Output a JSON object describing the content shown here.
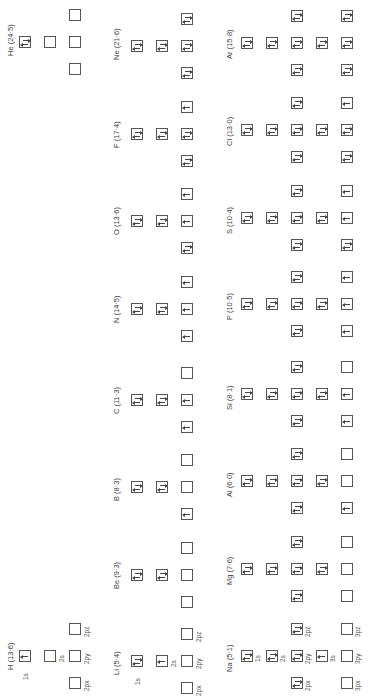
{
  "diagram": {
    "orientation": "rotated-90-ccw",
    "orbital_labels_row1": [
      "1s",
      "2s",
      "2px",
      "2py",
      "2pz"
    ],
    "orbital_labels_row3": [
      "1s",
      "2s",
      "2px",
      "2py",
      "2pz",
      "3s",
      "3px",
      "3py",
      "3pz"
    ]
  },
  "elements": [
    {
      "symbol": "H",
      "label": "H (13·6)",
      "ie": "13·6",
      "config": {
        "1s": 1
      }
    },
    {
      "symbol": "He",
      "label": "He (24·5)",
      "ie": "24·5",
      "config": {
        "1s": 2
      }
    },
    {
      "symbol": "Li",
      "label": "Li (5·4)",
      "ie": "5·4",
      "config": {
        "1s": 2,
        "2s": 1
      }
    },
    {
      "symbol": "Be",
      "label": "Be (9·3)",
      "ie": "9·3",
      "config": {
        "1s": 2,
        "2s": 2
      }
    },
    {
      "symbol": "B",
      "label": "B (8·3)",
      "ie": "8·3",
      "config": {
        "1s": 2,
        "2s": 2,
        "2px": 1
      }
    },
    {
      "symbol": "C",
      "label": "C (11·3)",
      "ie": "11·3",
      "config": {
        "1s": 2,
        "2s": 2,
        "2px": 1,
        "2py": 1
      }
    },
    {
      "symbol": "N",
      "label": "N (14·5)",
      "ie": "14·5",
      "config": {
        "1s": 2,
        "2s": 2,
        "2px": 1,
        "2py": 1,
        "2pz": 1
      }
    },
    {
      "symbol": "O",
      "label": "O (13·6)",
      "ie": "13·6",
      "config": {
        "1s": 2,
        "2s": 2,
        "2px": 2,
        "2py": 1,
        "2pz": 1
      }
    },
    {
      "symbol": "F",
      "label": "F (17·4)",
      "ie": "17·4",
      "config": {
        "1s": 2,
        "2s": 2,
        "2px": 2,
        "2py": 2,
        "2pz": 1
      }
    },
    {
      "symbol": "Ne",
      "label": "Ne (21·6)",
      "ie": "21·6",
      "config": {
        "1s": 2,
        "2s": 2,
        "2px": 2,
        "2py": 2,
        "2pz": 2
      }
    },
    {
      "symbol": "Na",
      "label": "Na (5·1)",
      "ie": "5·1",
      "config": {
        "1s": 2,
        "2s": 2,
        "2p": 6,
        "3s": 1
      }
    },
    {
      "symbol": "Mg",
      "label": "Mg (7·6)",
      "ie": "7·6",
      "config": {
        "1s": 2,
        "2s": 2,
        "2p": 6,
        "3s": 2
      }
    },
    {
      "symbol": "Al",
      "label": "Al (6·0)",
      "ie": "6·0",
      "config": {
        "1s": 2,
        "2s": 2,
        "2p": 6,
        "3s": 2,
        "3px": 1
      }
    },
    {
      "symbol": "Si",
      "label": "Si (8·1)",
      "ie": "8·1",
      "config": {
        "1s": 2,
        "2s": 2,
        "2p": 6,
        "3s": 2,
        "3px": 1,
        "3py": 1
      }
    },
    {
      "symbol": "P",
      "label": "P (10·5)",
      "ie": "10·5",
      "config": {
        "1s": 2,
        "2s": 2,
        "2p": 6,
        "3s": 2,
        "3px": 1,
        "3py": 1,
        "3pz": 1
      }
    },
    {
      "symbol": "S",
      "label": "S (10·4)",
      "ie": "10·4",
      "config": {
        "1s": 2,
        "2s": 2,
        "2p": 6,
        "3s": 2,
        "3px": 2,
        "3py": 1,
        "3pz": 1
      }
    },
    {
      "symbol": "Cl",
      "label": "Cl (13·0)",
      "ie": "13·0",
      "config": {
        "1s": 2,
        "2s": 2,
        "2p": 6,
        "3s": 2,
        "3px": 2,
        "3py": 2,
        "3pz": 1
      }
    },
    {
      "symbol": "Ar",
      "label": "Ar (15·8)",
      "ie": "15·8",
      "config": {
        "1s": 2,
        "2s": 2,
        "2p": 6,
        "3s": 2,
        "3px": 2,
        "3py": 2,
        "3pz": 2
      }
    }
  ],
  "labels": {
    "H": "H (13·6)",
    "He": "He (24·5)",
    "Li": "Li (5·4)",
    "Be": "Be (9·3)",
    "B": "B (8·3)",
    "C": "C (11·3)",
    "N": "N (14·5)",
    "O": "O (13·6)",
    "F": "F (17·4)",
    "Ne": "Ne (21·6)",
    "Na": "Na (5·1)",
    "Mg": "Mg (7·6)",
    "Al": "Al (6·0)",
    "Si": "Si (8·1)",
    "P": "P (10·5)",
    "S": "S (10·4)",
    "Cl": "Cl (13·0)",
    "Ar": "Ar (15·8)",
    "o1s": "1s",
    "o2s": "2s",
    "o2px": "2px",
    "o2py": "2py",
    "o2pz": "2pz",
    "o3s": "3s",
    "o3px": "3px",
    "o3py": "3py",
    "o3pz": "3pz"
  }
}
